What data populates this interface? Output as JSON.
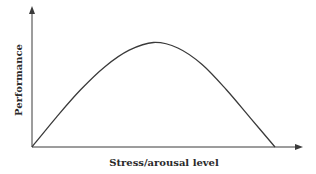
{
  "chart_data": {
    "type": "line",
    "title": "",
    "xlabel": "Stress/arousal level",
    "ylabel": "Performance",
    "grid": false,
    "legend": null,
    "x_ticks": [],
    "y_ticks": [],
    "xlim": [
      0,
      1
    ],
    "ylim": [
      0,
      1
    ],
    "series": [
      {
        "name": "Performance curve (inverted U)",
        "x": [
          0.0,
          0.1,
          0.2,
          0.3,
          0.4,
          0.5,
          0.6,
          0.7,
          0.8,
          0.9,
          1.0
        ],
        "values": [
          0.0,
          0.27,
          0.52,
          0.73,
          0.88,
          0.95,
          0.9,
          0.75,
          0.52,
          0.26,
          0.0
        ]
      }
    ]
  },
  "colors": {
    "axis": "#3a3a3a",
    "curve": "#3a3a3a",
    "background": "#ffffff"
  }
}
